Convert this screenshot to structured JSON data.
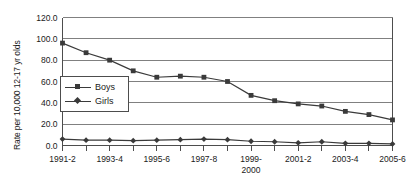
{
  "chart_data": {
    "type": "line",
    "title": "",
    "xlabel": "",
    "ylabel": "Rate per 10,000 12-17 yr olds",
    "ylim": [
      0,
      120
    ],
    "ytick_labels": [
      "0.0",
      "20.0",
      "40.0",
      "60.0",
      "80.0",
      "100.0",
      "120.0"
    ],
    "ytick_values": [
      0,
      20,
      40,
      60,
      80,
      100,
      120
    ],
    "grid": true,
    "legend_position": "inside-left",
    "x_index": [
      0,
      1,
      2,
      3,
      4,
      5,
      6,
      7,
      8,
      9,
      10,
      11,
      12,
      13,
      14
    ],
    "xtick_labels": [
      {
        "index": 0,
        "line1": "1991-2",
        "line2": ""
      },
      {
        "index": 2,
        "line1": "1993-4",
        "line2": ""
      },
      {
        "index": 4,
        "line1": "1995-6",
        "line2": ""
      },
      {
        "index": 6,
        "line1": "1997-8",
        "line2": ""
      },
      {
        "index": 8,
        "line1": "1999-",
        "line2": "2000"
      },
      {
        "index": 10,
        "line1": "2001-2",
        "line2": ""
      },
      {
        "index": 12,
        "line1": "2003-4",
        "line2": ""
      },
      {
        "index": 14,
        "line1": "2005-6",
        "line2": ""
      }
    ],
    "series": [
      {
        "name": "Boys",
        "marker": "square",
        "color": "#3a3a3a",
        "values": [
          96,
          87,
          80,
          70,
          64,
          65,
          64,
          60,
          47,
          42,
          39,
          37,
          32,
          29,
          24
        ]
      },
      {
        "name": "Girls",
        "marker": "diamond",
        "color": "#3a3a3a",
        "values": [
          6,
          5,
          5,
          4.5,
          5,
          5.5,
          6,
          5.5,
          4,
          3.5,
          2.5,
          3.5,
          2,
          2,
          1.5
        ]
      }
    ]
  },
  "legend": {
    "items": [
      {
        "label": "Boys",
        "marker": "square"
      },
      {
        "label": "Girls",
        "marker": "diamond"
      }
    ]
  }
}
